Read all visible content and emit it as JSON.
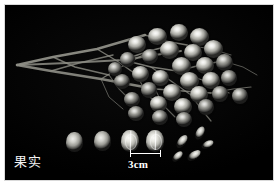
{
  "figure": {
    "caption_label": "果实",
    "background_color": "#000000",
    "border_color": "#ffffff"
  },
  "scale": {
    "label": "3cm",
    "bar_length_px": 31,
    "unit": "cm",
    "value": 3
  },
  "specimen": {
    "cluster_name": "infructescence",
    "berry_count": 31,
    "loose_whole_fruit_count": 2,
    "loose_cut_fruit_count": 2,
    "loose_seed_count": 5,
    "berries": [
      {
        "x": 148,
        "y": 28,
        "w": 19,
        "h": 17,
        "dim": false
      },
      {
        "x": 170,
        "y": 24,
        "w": 18,
        "h": 17,
        "dim": false
      },
      {
        "x": 190,
        "y": 28,
        "w": 19,
        "h": 18,
        "dim": false
      },
      {
        "x": 128,
        "y": 36,
        "w": 18,
        "h": 17,
        "dim": false
      },
      {
        "x": 160,
        "y": 41,
        "w": 19,
        "h": 18,
        "dim": false
      },
      {
        "x": 184,
        "y": 44,
        "w": 18,
        "h": 17,
        "dim": false
      },
      {
        "x": 204,
        "y": 40,
        "w": 19,
        "h": 18,
        "dim": false
      },
      {
        "x": 142,
        "y": 49,
        "w": 16,
        "h": 15,
        "dim": true
      },
      {
        "x": 120,
        "y": 52,
        "w": 15,
        "h": 15,
        "dim": true
      },
      {
        "x": 172,
        "y": 57,
        "w": 19,
        "h": 18,
        "dim": false
      },
      {
        "x": 196,
        "y": 57,
        "w": 18,
        "h": 17,
        "dim": false
      },
      {
        "x": 216,
        "y": 54,
        "w": 17,
        "h": 17,
        "dim": true
      },
      {
        "x": 132,
        "y": 66,
        "w": 17,
        "h": 16,
        "dim": false
      },
      {
        "x": 152,
        "y": 70,
        "w": 17,
        "h": 16,
        "dim": false
      },
      {
        "x": 180,
        "y": 72,
        "w": 19,
        "h": 18,
        "dim": false
      },
      {
        "x": 202,
        "y": 72,
        "w": 18,
        "h": 17,
        "dim": false
      },
      {
        "x": 221,
        "y": 70,
        "w": 16,
        "h": 16,
        "dim": true
      },
      {
        "x": 114,
        "y": 74,
        "w": 16,
        "h": 15,
        "dim": true
      },
      {
        "x": 141,
        "y": 82,
        "w": 16,
        "h": 16,
        "dim": true
      },
      {
        "x": 163,
        "y": 84,
        "w": 18,
        "h": 17,
        "dim": false
      },
      {
        "x": 190,
        "y": 86,
        "w": 18,
        "h": 17,
        "dim": false
      },
      {
        "x": 212,
        "y": 86,
        "w": 16,
        "h": 16,
        "dim": true
      },
      {
        "x": 232,
        "y": 88,
        "w": 16,
        "h": 16,
        "dim": true
      },
      {
        "x": 124,
        "y": 92,
        "w": 16,
        "h": 15,
        "dim": true
      },
      {
        "x": 150,
        "y": 96,
        "w": 17,
        "h": 16,
        "dim": false
      },
      {
        "x": 174,
        "y": 98,
        "w": 18,
        "h": 17,
        "dim": false
      },
      {
        "x": 198,
        "y": 99,
        "w": 16,
        "h": 16,
        "dim": true
      },
      {
        "x": 128,
        "y": 106,
        "w": 16,
        "h": 15,
        "dim": true
      },
      {
        "x": 152,
        "y": 110,
        "w": 16,
        "h": 15,
        "dim": true
      },
      {
        "x": 176,
        "y": 112,
        "w": 16,
        "h": 15,
        "dim": true
      },
      {
        "x": 108,
        "y": 62,
        "w": 14,
        "h": 14,
        "dim": true
      }
    ],
    "loose_fruits": [
      {
        "type": "whole",
        "x": 66,
        "y": 132,
        "w": 17,
        "h": 20
      },
      {
        "type": "whole",
        "x": 94,
        "y": 131,
        "w": 17,
        "h": 20
      },
      {
        "type": "cut",
        "x": 121,
        "y": 130,
        "w": 18,
        "h": 22
      },
      {
        "type": "cut",
        "x": 146,
        "y": 130,
        "w": 18,
        "h": 22
      }
    ],
    "loose_seeds": [
      {
        "x": 178,
        "y": 134,
        "w": 8,
        "h": 15,
        "rot": 38
      },
      {
        "x": 190,
        "y": 148,
        "w": 8,
        "h": 15,
        "rot": 55
      },
      {
        "x": 196,
        "y": 126,
        "w": 8,
        "h": 14,
        "rot": 28
      },
      {
        "x": 174,
        "y": 150,
        "w": 7,
        "h": 13,
        "rot": 45
      },
      {
        "x": 204,
        "y": 138,
        "w": 7,
        "h": 13,
        "rot": 62
      }
    ]
  }
}
